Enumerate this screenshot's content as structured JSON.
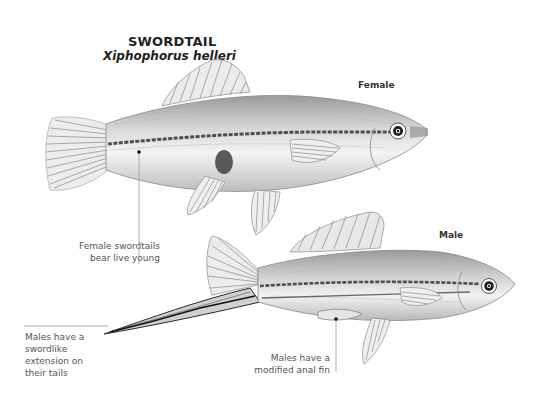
{
  "title": "SWORDTAIL",
  "scientific_name": "Xiphophorus helleri",
  "labels": {
    "female": "Female",
    "male": "Male"
  },
  "annotations": {
    "female_young": [
      "Female swordtails",
      "bear live young"
    ],
    "male_sword": [
      "Males have a",
      "swordlike",
      "extension on",
      "their tails"
    ],
    "male_anal_fin": [
      "Males have a",
      "modified anal fin"
    ]
  },
  "colors": {
    "background": "#ffffff",
    "text_dark": "#222222",
    "text_note": "#555555",
    "leader_line": "#999999",
    "fish_body": "#dcdcdc",
    "fish_stripe": "#555555"
  }
}
